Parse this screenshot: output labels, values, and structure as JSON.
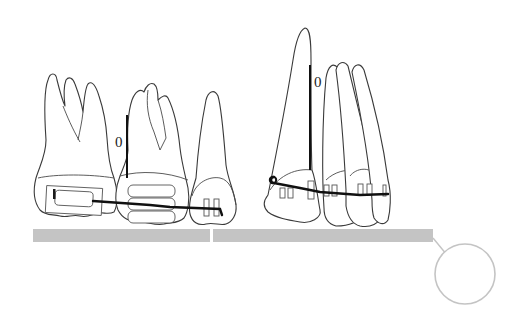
{
  "diagram": {
    "type": "orthodontic illustration",
    "labels": {
      "left_gap_marker": "0",
      "right_gap_marker": "0"
    },
    "groups": [
      {
        "name": "posterior-segment",
        "teeth": [
          "molar",
          "premolar",
          "canine"
        ],
        "appliance": "molar tube, premolar band, canine bracket with archwire"
      },
      {
        "name": "anterior-segment",
        "teeth": [
          "lateral-incisor",
          "central-incisors"
        ],
        "appliance": "twin brackets with archwire and loop"
      }
    ],
    "colors": {
      "outline": "#3a3a3a",
      "wire": "#111111",
      "base_bar": "#c4c4c4",
      "callout_circle": "#c4c4c4",
      "background": "#ffffff"
    }
  }
}
